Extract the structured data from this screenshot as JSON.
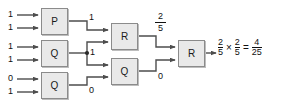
{
  "diagram": {
    "type": "logic-gate-network",
    "title": "",
    "gates": [
      {
        "id": "gate-p-1",
        "label": "P",
        "x": 41,
        "y": 8,
        "w": 27,
        "h": 27
      },
      {
        "id": "gate-q-1",
        "label": "Q",
        "x": 41,
        "y": 40,
        "w": 27,
        "h": 27
      },
      {
        "id": "gate-q-2",
        "label": "Q",
        "x": 41,
        "y": 72,
        "w": 27,
        "h": 27
      },
      {
        "id": "gate-r-1",
        "label": "R",
        "x": 111,
        "y": 23,
        "w": 27,
        "h": 27
      },
      {
        "id": "gate-q-3",
        "label": "Q",
        "x": 111,
        "y": 58,
        "w": 27,
        "h": 27
      },
      {
        "id": "gate-r-2",
        "label": "R",
        "x": 178,
        "y": 40,
        "w": 27,
        "h": 27
      }
    ],
    "inputs": [
      {
        "name": "input-p1-a",
        "value": "1"
      },
      {
        "name": "input-p1-b",
        "value": "1"
      },
      {
        "name": "input-q1-a",
        "value": "1"
      },
      {
        "name": "input-q1-b",
        "value": "1"
      },
      {
        "name": "input-q2-a",
        "value": "0"
      },
      {
        "name": "input-q2-b",
        "value": "1"
      }
    ],
    "wire_labels": [
      {
        "name": "label-p1-out",
        "value": "1"
      },
      {
        "name": "label-q1-out",
        "value": "1"
      },
      {
        "name": "label-q2-out",
        "value": "0"
      },
      {
        "name": "label-q3-out",
        "value": "0"
      }
    ],
    "fraction_labels": [
      {
        "name": "label-r1-out",
        "numerator": "2",
        "denominator": "5"
      }
    ],
    "result_equation": {
      "left_numerator": "2",
      "left_denominator": "5",
      "times": "×",
      "right_numerator": "2",
      "right_denominator": "5",
      "equals": "=",
      "result_numerator": "4",
      "result_denominator": "25"
    },
    "colors": {
      "box_fill": "#e9e9e9",
      "box_stroke": "#8b8b8b",
      "wire": "#4d4d4d",
      "text": "#111111",
      "background": "#ffffff"
    }
  }
}
